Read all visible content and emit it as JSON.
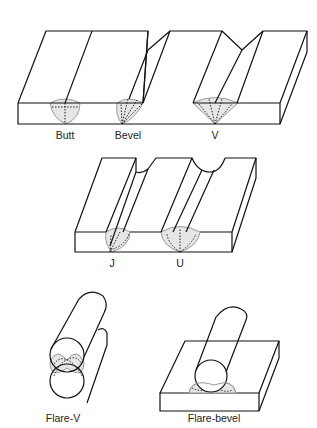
{
  "colors": {
    "stroke": "#111111",
    "weld_fill": "#e6e6e6",
    "weld_outline": "#999999"
  },
  "joints": [
    {
      "id": "butt",
      "label": "Butt"
    },
    {
      "id": "bevel",
      "label": "Bevel"
    },
    {
      "id": "v",
      "label": "V"
    },
    {
      "id": "j",
      "label": "J"
    },
    {
      "id": "u",
      "label": "U"
    },
    {
      "id": "flare-v",
      "label": "Flare-V"
    },
    {
      "id": "flare-bevel",
      "label": "Flare-bevel"
    }
  ]
}
